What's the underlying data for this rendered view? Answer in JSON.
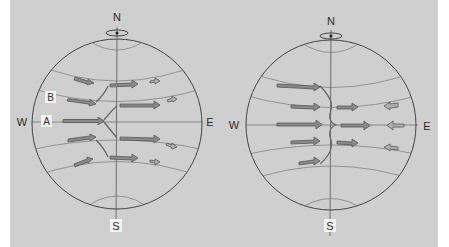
{
  "figure": {
    "background_color": "#cfcfcf",
    "outline_color": "#444444",
    "arrow_fill": "#8a8a8a",
    "arrow_stroke": "#555555",
    "small_arrow_fill": "#b0b0b0"
  },
  "left_globe": {
    "compass": {
      "north": "N",
      "south": "S",
      "west": "W",
      "east": "E"
    },
    "labels": {
      "a": "A",
      "b": "B"
    }
  },
  "right_globe": {
    "compass": {
      "north": "N",
      "south": "S",
      "west": "W",
      "east": "E"
    }
  }
}
